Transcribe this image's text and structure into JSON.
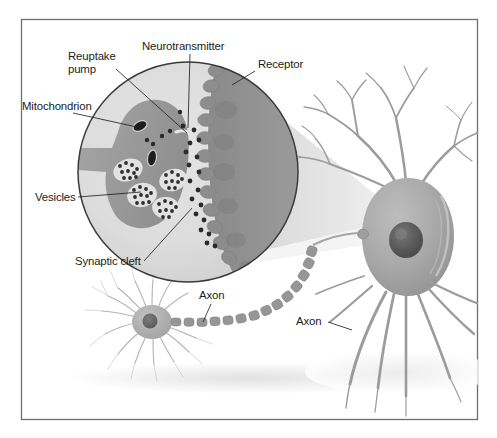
{
  "figure": {
    "frame": {
      "border_color": "#6f6f6f",
      "background_color": "#ffffff"
    },
    "palette": {
      "outline": "#3a3a3a",
      "label_text": "#1c1c1c",
      "leader_line": "#232323",
      "magnifier_fill": "#d9d9d9",
      "presynaptic_fill": "#9a9a9a",
      "postsynaptic_fill": "#8e8e8e",
      "vesicle_halo": "#e6e6e6",
      "granule": "#333333",
      "mitochondrion": "#1a1a1a",
      "neuron_body": "#a8a8a8",
      "neuron_nucleus": "#5e5e5e",
      "axon_segment": "#909090",
      "cone_fill": "#dcdcdc",
      "ground_shadow": "#e8e8e8"
    },
    "labels": [
      {
        "id": "mitochondrion",
        "text": "Mitochondrion",
        "x": 22,
        "y": 110,
        "anchor": "start",
        "lines": 1
      },
      {
        "id": "reuptake-pump",
        "text": "Reuptake",
        "text2": "pump",
        "x": 68,
        "y": 60,
        "anchor": "start",
        "lines": 2
      },
      {
        "id": "neurotransmitter",
        "text": "Neurotransmitter",
        "x": 142,
        "y": 50,
        "anchor": "start",
        "lines": 1
      },
      {
        "id": "receptor",
        "text": "Receptor",
        "x": 258,
        "y": 68,
        "anchor": "start",
        "lines": 1
      },
      {
        "id": "vesicles",
        "text": "Vesicles",
        "x": 35,
        "y": 201,
        "anchor": "start",
        "lines": 1
      },
      {
        "id": "synaptic-cleft",
        "text": "Synaptic cleft",
        "x": 75,
        "y": 265,
        "anchor": "start",
        "lines": 1
      },
      {
        "id": "axon-left",
        "text": "Axon",
        "x": 199,
        "y": 299,
        "anchor": "start",
        "lines": 1
      },
      {
        "id": "axon-right",
        "text": "Axon",
        "x": 296,
        "y": 325,
        "anchor": "start",
        "lines": 1
      }
    ],
    "structures": [
      {
        "id": "magnifier-circle",
        "name": "magnified-synapse-view"
      },
      {
        "id": "presynaptic-terminal",
        "name": "presynaptic-axon-terminal"
      },
      {
        "id": "postsynaptic-membrane",
        "name": "postsynaptic-cell-membrane"
      },
      {
        "id": "synaptic-cleft-gap",
        "name": "synaptic-cleft"
      },
      {
        "id": "magnifier-cone",
        "name": "magnifier-connector-cone"
      },
      {
        "id": "neuron-large",
        "name": "postsynaptic-neuron"
      },
      {
        "id": "neuron-small",
        "name": "presynaptic-neuron"
      },
      {
        "id": "axon-chain",
        "name": "myelinated-axon"
      }
    ]
  }
}
